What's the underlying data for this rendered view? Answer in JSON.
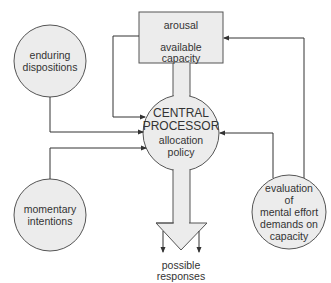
{
  "diagram": {
    "type": "flow-diagram",
    "colors": {
      "fill": "#ececec",
      "stroke": "#444444",
      "text": "#333333",
      "background": "#ffffff"
    },
    "nodes": {
      "capacity_box": {
        "top_label": "arousal",
        "bottom_label_line1": "available",
        "bottom_label_line2": "capacity"
      },
      "enduring": {
        "line1": "enduring",
        "line2": "dispositions"
      },
      "momentary": {
        "line1": "momentary",
        "line2": "intentions"
      },
      "central": {
        "line1": "CENTRAL",
        "line2": "PROCESSOR",
        "line3": "allocation",
        "line4": "policy"
      },
      "evaluation": {
        "line1": "evaluation",
        "line2": "of",
        "line3": "mental effort",
        "line4": "demands on",
        "line5": "capacity"
      },
      "responses": {
        "line1": "possible",
        "line2": "responses"
      }
    },
    "edges": [
      {
        "from": "arousal",
        "to": "central processor"
      },
      {
        "from": "enduring dispositions",
        "to": "central processor"
      },
      {
        "from": "momentary intentions",
        "to": "central processor"
      },
      {
        "from": "evaluation of mental effort demands on capacity",
        "to": "central processor"
      },
      {
        "from": "evaluation of mental effort demands on capacity",
        "to": "arousal / available capacity"
      },
      {
        "from": "available capacity",
        "to": "central processor"
      },
      {
        "from": "central processor",
        "to": "possible responses"
      }
    ]
  }
}
